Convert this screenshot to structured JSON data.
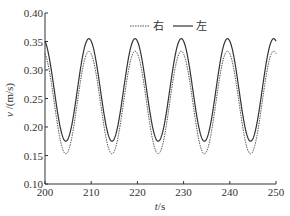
{
  "chart_data": {
    "type": "line",
    "title": "",
    "xlabel": "t/s",
    "ylabel": "v /(m/s)",
    "xlim": [
      200,
      250
    ],
    "ylim": [
      0.1,
      0.4
    ],
    "xticks": [
      200,
      210,
      220,
      230,
      240,
      250
    ],
    "xtick_labels": [
      "200",
      "210",
      "220",
      "230",
      "240",
      "250"
    ],
    "yticks": [
      0.1,
      0.15,
      0.2,
      0.25,
      0.3,
      0.35,
      0.4
    ],
    "ytick_labels": [
      "0.10",
      "0.15",
      "0.20",
      "0.25",
      "0.30",
      "0.35",
      "0.40"
    ],
    "grid": false,
    "legend_position": "top-center",
    "period": 10,
    "series": [
      {
        "name": "右",
        "style": "dashed",
        "color": "#555555",
        "mean": 0.243,
        "amplitude": 0.09,
        "peak_times": [
          209.5,
          219.5,
          229.5,
          239.5,
          249.5
        ],
        "trough_times": [
          204.5,
          214.5,
          224.5,
          234.5,
          244.5
        ],
        "peak_value": 0.333,
        "trough_value": 0.153,
        "x": [
          200,
          202,
          204.5,
          207,
          209.5,
          212,
          214.5,
          217,
          219.5,
          222,
          224.5,
          227,
          229.5,
          232,
          234.5,
          237,
          239.5,
          242,
          244.5,
          247,
          249.5,
          250
        ],
        "values": [
          0.33,
          0.27,
          0.153,
          0.215,
          0.333,
          0.27,
          0.153,
          0.215,
          0.333,
          0.27,
          0.153,
          0.215,
          0.333,
          0.27,
          0.153,
          0.215,
          0.333,
          0.27,
          0.153,
          0.215,
          0.333,
          0.33
        ]
      },
      {
        "name": "左",
        "style": "solid",
        "color": "#333333",
        "mean": 0.265,
        "amplitude": 0.09,
        "peak_times": [
          209.5,
          219.5,
          229.5,
          239.5,
          249.5
        ],
        "trough_times": [
          204.5,
          214.5,
          224.5,
          234.5,
          244.5
        ],
        "peak_value": 0.355,
        "trough_value": 0.175,
        "x": [
          200,
          202,
          204.5,
          207,
          209.5,
          212,
          214.5,
          217,
          219.5,
          222,
          224.5,
          227,
          229.5,
          232,
          234.5,
          237,
          239.5,
          242,
          244.5,
          247,
          249.5,
          250
        ],
        "values": [
          0.352,
          0.29,
          0.175,
          0.237,
          0.355,
          0.29,
          0.175,
          0.237,
          0.355,
          0.29,
          0.175,
          0.237,
          0.355,
          0.29,
          0.175,
          0.237,
          0.355,
          0.29,
          0.175,
          0.237,
          0.355,
          0.352
        ]
      }
    ]
  },
  "legend": {
    "items": [
      {
        "label": "右",
        "style": "dashed"
      },
      {
        "label": "左",
        "style": "solid"
      }
    ]
  },
  "axes": {
    "x_label_italic": "t",
    "x_label_unit": "/s",
    "y_label_italic": "v",
    "y_label_unit": " /(m/s)"
  }
}
